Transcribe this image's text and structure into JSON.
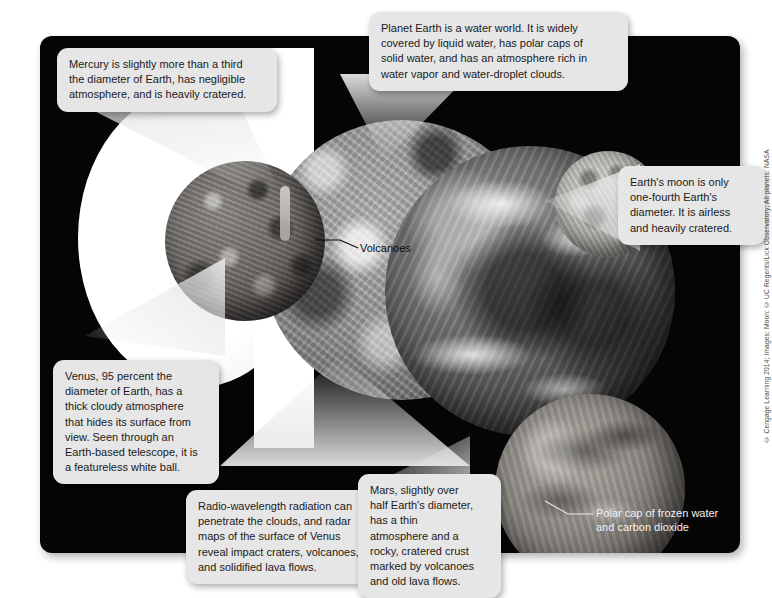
{
  "figure": {
    "panel_background": "#050505",
    "callout_background": "#e6e6e6",
    "page_background": "#ffffff"
  },
  "callouts": [
    {
      "id": "mercury",
      "name": "mercury-callout",
      "text": "Mercury is slightly more than a third\nthe diameter of Earth, has negligible\natmosphere, and is heavily cratered."
    },
    {
      "id": "earth",
      "name": "earth-callout",
      "text": "Planet Earth is a water world. It is widely\ncovered by liquid water, has polar caps of\nsolid water, and has an atmosphere rich in\nwater vapor and water-droplet clouds."
    },
    {
      "id": "moon",
      "name": "moon-callout",
      "text": "Earth's moon is only\none-fourth Earth's\ndiameter. It is airless\nand heavily cratered."
    },
    {
      "id": "venus",
      "name": "venus-callout",
      "text": "Venus, 95 percent the\ndiameter of Earth, has a\nthick cloudy atmosphere\nthat hides its surface from\nview. Seen through an\nEarth-based telescope, it is\na featureless white ball."
    },
    {
      "id": "radar",
      "name": "radar-venus-callout",
      "text": "Radio-wavelength radiation can\npenetrate the clouds, and radar\nmaps of the surface of Venus\nreveal impact craters, volcanoes,\nand solidified lava flows."
    },
    {
      "id": "mars",
      "name": "mars-callout",
      "text": "Mars, slightly over\nhalf Earth's diameter,\nhas a thin\natmosphere and a\nrocky, cratered crust\nmarked by volcanoes\nand old lava flows."
    }
  ],
  "labels": [
    {
      "id": "volcanoes",
      "name": "volcanoes-label",
      "text": "Volcanoes",
      "color": "#0b0b0b"
    },
    {
      "id": "polar_cap",
      "name": "polar-cap-label",
      "text": "Polar cap of frozen water\nand carbon dioxide",
      "color": "#f2f2f2"
    }
  ],
  "bodies": [
    {
      "id": "mercury",
      "name": "mercury-sphere"
    },
    {
      "id": "venus_white",
      "name": "venus-white-sphere"
    },
    {
      "id": "venus_radar",
      "name": "venus-radar-sphere"
    },
    {
      "id": "earth",
      "name": "earth-sphere"
    },
    {
      "id": "moon",
      "name": "moon-sphere"
    },
    {
      "id": "mars",
      "name": "mars-sphere"
    },
    {
      "id": "mars_polar",
      "name": "mars-polar-cap"
    }
  ],
  "credit": {
    "text": "© Cengage Learning 2014; Images: Moon: © UC Regents/Lick Observatory; All planets: NASA"
  }
}
